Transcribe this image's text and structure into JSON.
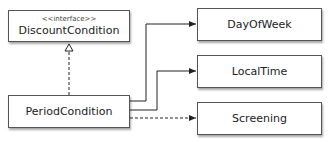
{
  "diagram": {
    "type": "uml-class-diagram",
    "classes": [
      {
        "id": "discount-condition",
        "name": "DiscountCondition",
        "stereotype": "<<interface>>"
      },
      {
        "id": "period-condition",
        "name": "PeriodCondition"
      },
      {
        "id": "day-of-week",
        "name": "DayOfWeek"
      },
      {
        "id": "local-time",
        "name": "LocalTime"
      },
      {
        "id": "screening",
        "name": "Screening"
      }
    ],
    "relations": [
      {
        "from": "PeriodCondition",
        "to": "DiscountCondition",
        "kind": "realization",
        "style": "dashed-hollow-triangle"
      },
      {
        "from": "PeriodCondition",
        "to": "DayOfWeek",
        "kind": "association",
        "style": "solid-arrow"
      },
      {
        "from": "PeriodCondition",
        "to": "LocalTime",
        "kind": "association",
        "style": "solid-arrow"
      },
      {
        "from": "PeriodCondition",
        "to": "Screening",
        "kind": "dependency",
        "style": "dashed-arrow"
      }
    ],
    "colors": {
      "line": "#222222",
      "border": "#555555",
      "background": "#ffffff"
    }
  }
}
